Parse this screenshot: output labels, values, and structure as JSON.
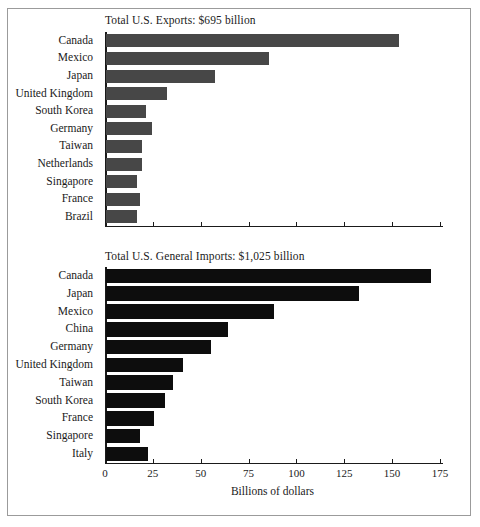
{
  "figure": {
    "frame_color": "#9b9b9b",
    "background": "#ffffff"
  },
  "chart_data": [
    {
      "type": "bar",
      "orientation": "horizontal",
      "id": "exports",
      "title": "Total U.S. Exports: $695 billion",
      "xlabel": "",
      "ylabel": "",
      "xlim": [
        0,
        175
      ],
      "xticks": [
        0,
        25,
        50,
        75,
        100,
        125,
        150,
        175
      ],
      "xticklabels": [
        "",
        "",
        "",
        "",
        "",
        "",
        "",
        ""
      ],
      "grid": false,
      "legend": false,
      "bar_color": "#474747",
      "categories": [
        "Canada",
        "Mexico",
        "Japan",
        "United Kingdom",
        "South Korea",
        "Germany",
        "Taiwan",
        "Netherlands",
        "Singapore",
        "France",
        "Brazil"
      ],
      "values": [
        153,
        85,
        57,
        32,
        21,
        24,
        19,
        19,
        16,
        18,
        16
      ],
      "units": "Billions of dollars",
      "total_label": "$695 billion"
    },
    {
      "type": "bar",
      "orientation": "horizontal",
      "id": "imports",
      "title": "Total U.S. General Imports: $1,025 billion",
      "xlabel": "Billions of dollars",
      "ylabel": "",
      "xlim": [
        0,
        175
      ],
      "xticks": [
        0,
        25,
        50,
        75,
        100,
        125,
        150,
        175
      ],
      "xticklabels": [
        "0",
        "25",
        "50",
        "75",
        "100",
        "125",
        "150",
        "175"
      ],
      "grid": false,
      "legend": false,
      "bar_color": "#0d0d0d",
      "categories": [
        "Canada",
        "Japan",
        "Mexico",
        "China",
        "Germany",
        "United Kingdom",
        "Taiwan",
        "South Korea",
        "France",
        "Singapore",
        "Italy"
      ],
      "values": [
        170,
        132,
        88,
        64,
        55,
        40,
        35,
        31,
        25,
        18,
        22
      ],
      "units": "Billions of dollars",
      "total_label": "$1,025 billion"
    }
  ]
}
